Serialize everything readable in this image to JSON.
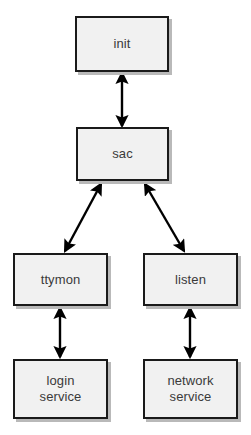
{
  "diagram": {
    "background_color": "#ffffff",
    "node_fill_color": "#f1f1f1",
    "node_border_color": "#1a1a1a",
    "text_color": "#3a3a3a",
    "arrow_color": "#000000",
    "nodes": [
      {
        "id": "init",
        "label": "init",
        "x": 75,
        "y": 16,
        "width": 94,
        "height": 56
      },
      {
        "id": "sac",
        "label": "sac",
        "x": 76,
        "y": 127,
        "width": 93,
        "height": 54
      },
      {
        "id": "ttymon",
        "label": "ttymon",
        "x": 13,
        "y": 253,
        "width": 95,
        "height": 53
      },
      {
        "id": "listen",
        "label": "listen",
        "x": 143,
        "y": 253,
        "width": 95,
        "height": 53
      },
      {
        "id": "login-service",
        "label": "login\nservice",
        "x": 13,
        "y": 359,
        "width": 95,
        "height": 60
      },
      {
        "id": "network-service",
        "label": "network\nservice",
        "x": 143,
        "y": 359,
        "width": 95,
        "height": 60
      }
    ],
    "edges": [
      {
        "id": "init-sac",
        "from": "init",
        "to": "sac",
        "style": "double-arrow",
        "x1": 122,
        "y1": 73,
        "x2": 122,
        "y2": 126
      },
      {
        "id": "sac-ttymon",
        "from": "sac",
        "to": "ttymon",
        "style": "double-arrow",
        "x1": 101,
        "y1": 184,
        "x2": 65,
        "y2": 251
      },
      {
        "id": "sac-listen",
        "from": "sac",
        "to": "listen",
        "style": "double-arrow",
        "x1": 145,
        "y1": 184,
        "x2": 184,
        "y2": 251
      },
      {
        "id": "ttymon-login-service",
        "from": "ttymon",
        "to": "login-service",
        "style": "double-arrow",
        "x1": 60,
        "y1": 308,
        "x2": 60,
        "y2": 357
      },
      {
        "id": "listen-network-service",
        "from": "listen",
        "to": "network-service",
        "style": "double-arrow",
        "x1": 190,
        "y1": 308,
        "x2": 190,
        "y2": 357
      }
    ]
  }
}
